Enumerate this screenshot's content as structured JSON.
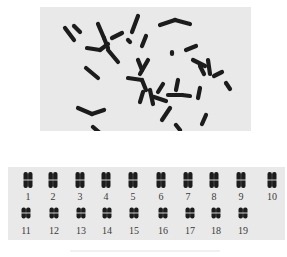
{
  "figure": {
    "colors": {
      "panel_bg": "#e9e9e9",
      "chromosome": "#1c1c1c",
      "label": "#3a3a3a",
      "page_bg": "#ffffff"
    }
  },
  "metaphase": {
    "chromosomes": [
      [
        65,
        28,
        74,
        40
      ],
      [
        74,
        26,
        80,
        32
      ],
      [
        98,
        24,
        104,
        38
      ],
      [
        104,
        38,
        108,
        48
      ],
      [
        87,
        48,
        100,
        50
      ],
      [
        100,
        50,
        108,
        44
      ],
      [
        112,
        38,
        122,
        33
      ],
      [
        108,
        50,
        118,
        62
      ],
      [
        138,
        16,
        132,
        32
      ],
      [
        146,
        36,
        142,
        46
      ],
      [
        128,
        40,
        130,
        42
      ],
      [
        160,
        25,
        175,
        20
      ],
      [
        175,
        20,
        190,
        24
      ],
      [
        172,
        52,
        172,
        54
      ],
      [
        186,
        50,
        196,
        46
      ],
      [
        86,
        68,
        98,
        78
      ],
      [
        78,
        108,
        92,
        114
      ],
      [
        92,
        114,
        104,
        110
      ],
      [
        93,
        127,
        101,
        134
      ],
      [
        138,
        60,
        142,
        70
      ],
      [
        148,
        60,
        140,
        74
      ],
      [
        128,
        78,
        142,
        80
      ],
      [
        142,
        80,
        146,
        90
      ],
      [
        143,
        92,
        140,
        102
      ],
      [
        150,
        90,
        153,
        104
      ],
      [
        163,
        84,
        158,
        92
      ],
      [
        178,
        80,
        176,
        90
      ],
      [
        154,
        97,
        166,
        101
      ],
      [
        168,
        95,
        182,
        95
      ],
      [
        182,
        95,
        190,
        96
      ],
      [
        200,
        88,
        198,
        98
      ],
      [
        193,
        60,
        205,
        66
      ],
      [
        200,
        66,
        204,
        74
      ],
      [
        208,
        60,
        210,
        74
      ],
      [
        214,
        76,
        222,
        72
      ],
      [
        226,
        83,
        230,
        89
      ],
      [
        170,
        108,
        162,
        120
      ],
      [
        176,
        125,
        180,
        130
      ],
      [
        206,
        115,
        202,
        124
      ]
    ]
  },
  "karyotype": {
    "rows": [
      [
        {
          "label": "1",
          "x": 28
        },
        {
          "label": "2",
          "x": 53
        },
        {
          "label": "3",
          "x": 80
        },
        {
          "label": "4",
          "x": 106
        },
        {
          "label": "5",
          "x": 133
        },
        {
          "label": "6",
          "x": 161
        },
        {
          "label": "7",
          "x": 188
        },
        {
          "label": "8",
          "x": 214
        },
        {
          "label": "9",
          "x": 241
        },
        {
          "label": "10",
          "x": 272
        }
      ],
      [
        {
          "label": "11",
          "x": 26
        },
        {
          "label": "12",
          "x": 54
        },
        {
          "label": "13",
          "x": 81
        },
        {
          "label": "14",
          "x": 107
        },
        {
          "label": "15",
          "x": 134
        },
        {
          "label": "16",
          "x": 163
        },
        {
          "label": "17",
          "x": 190
        },
        {
          "label": "18",
          "x": 216
        },
        {
          "label": "19",
          "x": 243
        }
      ]
    ],
    "row_y": [
      180,
      213
    ],
    "label_y": [
      192,
      226
    ]
  }
}
